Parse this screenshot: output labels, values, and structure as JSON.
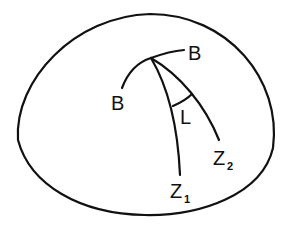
{
  "figure": {
    "colors": {
      "stroke": "#111111",
      "background": "#ffffff"
    },
    "labels": {
      "b_left": "B",
      "b_right": "B",
      "angle": "L",
      "z1_main": "Z",
      "z1_sub": "1",
      "z2_main": "Z",
      "z2_sub": "2"
    }
  }
}
